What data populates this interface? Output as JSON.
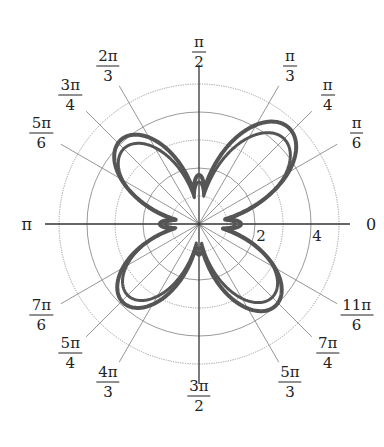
{
  "chart_data": {
    "type": "line",
    "subtype": "polar",
    "title": "",
    "radial_ticks": [
      2,
      4
    ],
    "radial_rings": [
      1,
      2,
      3,
      4,
      5
    ],
    "r_max": 5,
    "grid": true,
    "angle_spokes_deg": [
      0,
      30,
      45,
      60,
      90,
      120,
      135,
      150,
      180,
      210,
      225,
      240,
      270,
      300,
      315,
      330
    ],
    "angle_labels": [
      {
        "deg": 0,
        "text": "0"
      },
      {
        "deg": 30,
        "num": "π",
        "den": "6"
      },
      {
        "deg": 45,
        "num": "π",
        "den": "4"
      },
      {
        "deg": 60,
        "num": "π",
        "den": "3"
      },
      {
        "deg": 90,
        "num": "π",
        "den": "2"
      },
      {
        "deg": 120,
        "num": "2π",
        "den": "3"
      },
      {
        "deg": 135,
        "num": "3π",
        "den": "4"
      },
      {
        "deg": 150,
        "num": "5π",
        "den": "6"
      },
      {
        "deg": 180,
        "text": "π"
      },
      {
        "deg": 210,
        "num": "7π",
        "den": "6"
      },
      {
        "deg": 225,
        "num": "5π",
        "den": "4"
      },
      {
        "deg": 240,
        "num": "4π",
        "den": "3"
      },
      {
        "deg": 270,
        "num": "3π",
        "den": "2"
      },
      {
        "deg": 300,
        "num": "5π",
        "den": "3"
      },
      {
        "deg": 315,
        "num": "7π",
        "den": "4"
      },
      {
        "deg": 330,
        "num": "11π",
        "den": "6"
      }
    ],
    "curve": {
      "color": "#555555",
      "description": "four-petal polar curve traced twice (outer and inner trace), petals along diagonals, small lobes along axes",
      "traces": [
        {
          "name": "outer-trace",
          "petals": [
            {
              "center_deg": 47,
              "r_max": 4.7
            },
            {
              "center_deg": 133,
              "r_max": 4.1
            },
            {
              "center_deg": 226,
              "r_max": 3.9
            },
            {
              "center_deg": 313,
              "r_max": 4.0
            }
          ],
          "axis_lobes": [
            {
              "center_deg": 0,
              "r_max": 1.5
            },
            {
              "center_deg": 90,
              "r_max": 1.75
            },
            {
              "center_deg": 180,
              "r_max": 1.4
            },
            {
              "center_deg": 270,
              "r_max": 1.1
            }
          ]
        },
        {
          "name": "inner-trace",
          "petals": [
            {
              "center_deg": 45,
              "r_max": 4.3
            },
            {
              "center_deg": 135,
              "r_max": 3.8
            },
            {
              "center_deg": 225,
              "r_max": 3.6
            },
            {
              "center_deg": 315,
              "r_max": 3.7
            }
          ],
          "axis_lobes": [
            {
              "center_deg": 0,
              "r_max": 1.3
            },
            {
              "center_deg": 90,
              "r_max": 1.5
            },
            {
              "center_deg": 180,
              "r_max": 1.2
            },
            {
              "center_deg": 270,
              "r_max": 0.9
            }
          ]
        }
      ]
    }
  }
}
